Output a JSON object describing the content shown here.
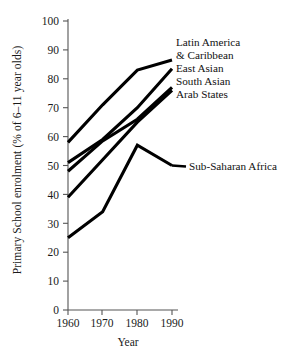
{
  "chart_data": {
    "type": "line",
    "title": "",
    "xlabel": "Year",
    "ylabel": "Primary School enrolment (% of 6–11 year olds)",
    "x": [
      1960,
      1970,
      1980,
      1990
    ],
    "xticklabels": [
      "1960",
      "1970",
      "1980",
      "1990"
    ],
    "yticks": [
      0,
      10,
      20,
      30,
      40,
      50,
      60,
      70,
      80,
      90,
      100
    ],
    "yticklabels": [
      "0",
      "10",
      "20",
      "30",
      "40",
      "50",
      "60",
      "70",
      "80",
      "90",
      "100"
    ],
    "xlim": [
      1960,
      1990
    ],
    "ylim": [
      0,
      100
    ],
    "grid": false,
    "legend_position": "right-inline-labels",
    "line_color": "#000000",
    "series": [
      {
        "name": "Latin America & Caribbean",
        "values": [
          58,
          71,
          83,
          86.5
        ]
      },
      {
        "name": "East Asian",
        "values": [
          51,
          59,
          70,
          83.5
        ]
      },
      {
        "name": "South Asian",
        "values": [
          48,
          58.5,
          66,
          77
        ]
      },
      {
        "name": "Arab States",
        "values": [
          39,
          52,
          65,
          76
        ]
      },
      {
        "name": "Sub-Saharan Africa",
        "values": [
          25,
          34,
          57,
          50
        ]
      }
    ]
  },
  "axes": {
    "y_title": "Primary School enrolment (% of 6–11 year olds)",
    "x_title": "Year",
    "y_ticks": [
      "100",
      "90",
      "80",
      "70",
      "60",
      "50",
      "40",
      "30",
      "20",
      "10",
      "0"
    ],
    "x_ticks": [
      "1960",
      "1970",
      "1980",
      "1990"
    ]
  },
  "series_labels": {
    "latin_america_line1": "Latin America",
    "latin_america_line2": "& Caribbean",
    "east_asian": "East Asian",
    "south_asian": "South Asian",
    "arab_states": "Arab States",
    "sub_saharan_africa": "Sub-Saharan Africa"
  }
}
